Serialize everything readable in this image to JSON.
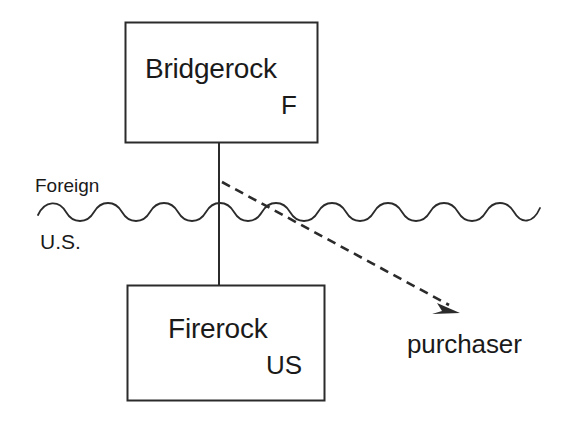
{
  "diagram": {
    "type": "entity-structure-diagram",
    "background_color": "#ffffff",
    "line_color": "#2b2b2b",
    "text_color": "#1a1a1a",
    "entities": [
      {
        "id": "bridgerock",
        "name": "Bridgerock",
        "jurisdiction": "F",
        "region": "Foreign"
      },
      {
        "id": "firerock",
        "name": "Firerock",
        "jurisdiction": "US",
        "region": "U.S."
      }
    ],
    "region_labels": {
      "above": "Foreign",
      "below": "U.S."
    },
    "nodes": {
      "purchaser": "purchaser"
    },
    "connectors": [
      {
        "id": "ownership-line",
        "style": "solid",
        "from": "bridgerock",
        "to": "firerock",
        "arrow": false
      },
      {
        "id": "sale-arrow",
        "style": "dashed",
        "from": "bridgerock",
        "to": "purchaser",
        "arrow": true
      },
      {
        "id": "border-wave",
        "style": "wavy",
        "meaning": "national-border"
      }
    ]
  }
}
